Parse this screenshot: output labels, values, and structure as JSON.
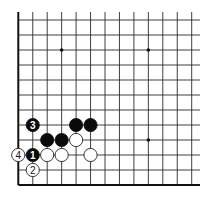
{
  "diagram": {
    "type": "go-board-partial",
    "grid": {
      "columns": 13,
      "rows": 12,
      "origin_x": 18.3,
      "origin_y": 185,
      "spacing_x": 14.45,
      "spacing_y": 15.0,
      "line_extend_top": 12,
      "line_extend_right": 200,
      "edges": [
        "left",
        "bottom"
      ]
    },
    "star_points": [
      {
        "col": 3,
        "row": 9
      },
      {
        "col": 9,
        "row": 9
      },
      {
        "col": 9,
        "row": 3
      }
    ],
    "stones": [
      {
        "color": "black",
        "col": 1,
        "row": 4,
        "label": "3"
      },
      {
        "color": "black",
        "col": 4,
        "row": 4,
        "label": ""
      },
      {
        "color": "black",
        "col": 5,
        "row": 4,
        "label": ""
      },
      {
        "color": "black",
        "col": 2,
        "row": 3,
        "label": ""
      },
      {
        "color": "black",
        "col": 3,
        "row": 3,
        "label": ""
      },
      {
        "color": "white",
        "col": 4,
        "row": 3,
        "label": ""
      },
      {
        "color": "black",
        "col": 1,
        "row": 2,
        "label": "1"
      },
      {
        "color": "white",
        "col": 2,
        "row": 2,
        "label": ""
      },
      {
        "color": "white",
        "col": 3,
        "row": 2,
        "label": ""
      },
      {
        "color": "white",
        "col": 5,
        "row": 2,
        "label": ""
      },
      {
        "color": "white",
        "col": 0,
        "row": 2,
        "label": "4"
      },
      {
        "color": "white",
        "col": 1,
        "row": 1,
        "label": "2"
      }
    ],
    "stone_radius": 6.6,
    "colors": {
      "black_stone": "#0a0a0a",
      "white_stone": "#ffffff",
      "line": "#2a2a2a",
      "background": "#ffffff"
    }
  }
}
